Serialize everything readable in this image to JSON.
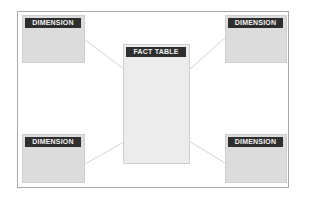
{
  "diagram": {
    "fact_table": {
      "label": "FACT TABLE"
    },
    "dimensions": [
      {
        "label": "DIMENSION",
        "position": "top-left"
      },
      {
        "label": "DIMENSION",
        "position": "top-right"
      },
      {
        "label": "DIMENSION",
        "position": "bottom-left"
      },
      {
        "label": "DIMENSION",
        "position": "bottom-right"
      }
    ],
    "colors": {
      "header_bg": "#2e2e2e",
      "box_bg": "#dcdcdc",
      "fact_bg": "#ececec",
      "line": "#c8c8c8"
    }
  }
}
